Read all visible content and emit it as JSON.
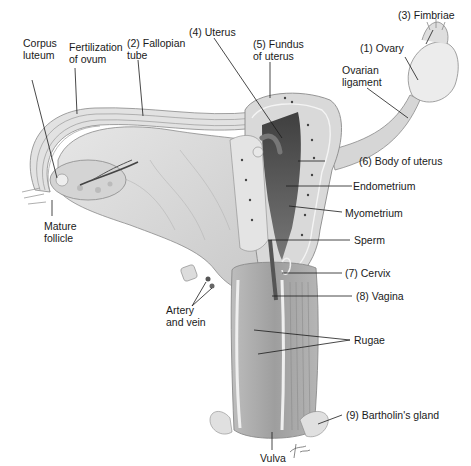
{
  "diagram": {
    "type": "anatomical illustration",
    "colors": {
      "background": "#ffffff",
      "tissue_light": "#dcdcdc",
      "tissue_mid": "#c4c4c4",
      "tissue_dark": "#7a7a7a",
      "cavity_dark": "#4a4a4a",
      "leader_line": "#1a1a1a",
      "text": "#1a1a1a"
    }
  },
  "labels": {
    "fimbriae": "(3) Fimbriae",
    "ovary": "(1) Ovary",
    "ovarian_ligament": "Ovarian\nligament",
    "uterus": "(4) Uterus",
    "fundus": "(5) Fundus\nof uterus",
    "fallopian_tube": "(2) Fallopian\ntube",
    "fertilization": "Fertilization\nof ovum",
    "corpus_luteum": "Corpus\nluteum",
    "body_of_uterus": "(6) Body of uterus",
    "endometrium": "Endometrium",
    "myometrium": "Myometrium",
    "sperm": "Sperm",
    "cervix": "(7) Cervix",
    "vagina": "(8) Vagina",
    "mature_follicle": "Mature\nfollicle",
    "artery_vein": "Artery\nand vein",
    "rugae": "Rugae",
    "bartholins_gland": "(9) Bartholin's gland",
    "vulva": "Vulva",
    "signature": "Tina"
  }
}
